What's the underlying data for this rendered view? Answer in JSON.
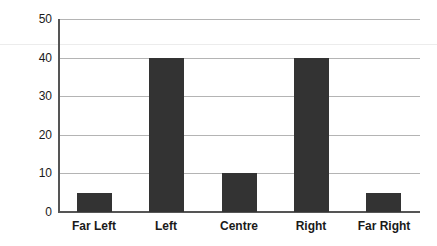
{
  "chart_data": {
    "type": "bar",
    "title": "",
    "subtitle": "",
    "xlabel": "",
    "ylabel": "",
    "categories": [
      "Far Left",
      "Left",
      "Centre",
      "Right",
      "Far Right"
    ],
    "values": [
      5,
      40,
      10,
      40,
      5
    ],
    "series": [
      {
        "name": "",
        "values": [
          5,
          40,
          10,
          40,
          5
        ]
      }
    ],
    "ylim": [
      0,
      50
    ],
    "yticks": [
      0,
      10,
      20,
      30,
      40,
      50
    ],
    "ytick_labels": [
      "0",
      "10",
      "20",
      "30",
      "40",
      "50"
    ],
    "grid": "horizontal",
    "legend": "none",
    "bar_color": "#333333",
    "grid_color": "#b4b4b4",
    "axis_color": "#555555",
    "text_color": "#1a1a1a",
    "background": "#ffffff"
  }
}
